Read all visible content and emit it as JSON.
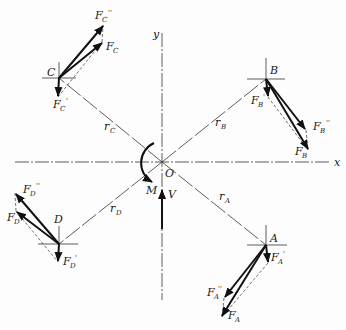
{
  "diagram": {
    "axes": {
      "x_label": "x",
      "y_label": "y",
      "origin_label": "O"
    },
    "couple": {
      "moment_label": "M",
      "shear_label": "V"
    },
    "points": [
      {
        "id": "A",
        "label": "A",
        "radius_label": "r",
        "radius_sub": "A",
        "force": "F",
        "force_sub": "A",
        "components": [
          {
            "label": "F",
            "sub": "A",
            "prime": "'"
          },
          {
            "label": "F",
            "sub": "A",
            "prime": "''"
          }
        ]
      },
      {
        "id": "B",
        "label": "B",
        "radius_label": "r",
        "radius_sub": "B",
        "force": "F",
        "force_sub": "B",
        "components": [
          {
            "label": "F",
            "sub": "B",
            "prime": "'"
          },
          {
            "label": "F",
            "sub": "B",
            "prime": "''"
          }
        ]
      },
      {
        "id": "C",
        "label": "C",
        "radius_label": "r",
        "radius_sub": "C",
        "force": "F",
        "force_sub": "C",
        "components": [
          {
            "label": "F",
            "sub": "C",
            "prime": "'"
          },
          {
            "label": "F",
            "sub": "C",
            "prime": "''"
          }
        ]
      },
      {
        "id": "D",
        "label": "D",
        "radius_label": "r",
        "radius_sub": "D",
        "force": "F",
        "force_sub": "D",
        "components": [
          {
            "label": "F",
            "sub": "D",
            "prime": "'"
          },
          {
            "label": "F",
            "sub": "D",
            "prime": "''"
          }
        ]
      }
    ]
  }
}
